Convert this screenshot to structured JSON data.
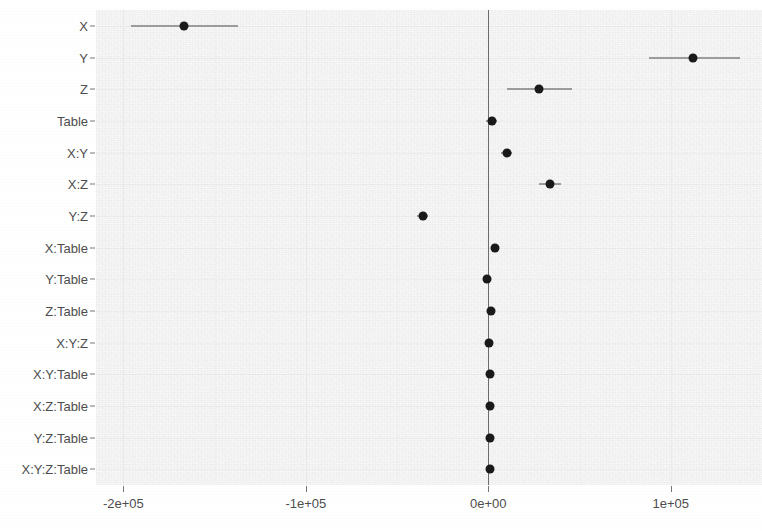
{
  "chart_data": {
    "type": "scatter",
    "title": "",
    "subtitle": "",
    "xlabel": "",
    "ylabel": "",
    "orientation": "horizontal",
    "grid": true,
    "legend": "none",
    "reference_line": 0,
    "xlim": [
      -215000,
      150000
    ],
    "x_ticks": [
      -200000,
      -100000,
      0,
      100000
    ],
    "x_tick_labels": [
      "-2e+05",
      "-1e+05",
      "0e+00",
      "1e+05"
    ],
    "categories": [
      "X",
      "Y",
      "Z",
      "Table",
      "X:Y",
      "X:Z",
      "Y:Z",
      "X:Table",
      "Y:Table",
      "Z:Table",
      "X:Y:Z",
      "X:Y:Table",
      "X:Z:Table",
      "Y:Z:Table",
      "X:Y:Z:Table"
    ],
    "values": [
      -167000,
      112000,
      28000,
      2000,
      10000,
      34000,
      -36000,
      3500,
      -500,
      1500,
      500,
      1000,
      1200,
      800,
      1000
    ],
    "ci_low": [
      -196000,
      88000,
      10000,
      -1000,
      7000,
      28000,
      -39000,
      2500,
      -1500,
      500,
      -200,
      200,
      400,
      100,
      200
    ],
    "ci_high": [
      -137000,
      138000,
      46000,
      5000,
      13000,
      40000,
      -33000,
      4500,
      500,
      2500,
      1200,
      1800,
      2000,
      1500,
      1800
    ]
  },
  "style": {
    "panel_background": "#f7f7f7",
    "point_color": "#1a1a1a",
    "errorbar_color": "#4a4a4a",
    "zero_line_color": "#6e6e6e",
    "gridline_color": "#ededed",
    "axis_text_color": "#4d4d4d"
  }
}
